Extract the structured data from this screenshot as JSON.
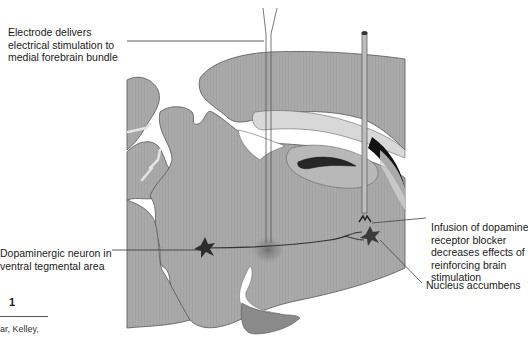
{
  "figure": {
    "number": "1",
    "citation_fragment": "ar, Kelley,"
  },
  "labels": {
    "electrode": [
      "Electrode delivers",
      "electrical stimulation to",
      "medial forebrain bundle"
    ],
    "dopaminergic_neuron": [
      "Dopaminergic neuron in",
      "ventral tegmental area"
    ],
    "infusion": [
      "Infusion of dopamine",
      "receptor blocker",
      "decreases effects of",
      "reinforcing brain",
      "stimulation"
    ],
    "nucleus_accumbens": "Nucleus accumbens"
  },
  "colors": {
    "brain_tissue": "#a9a9a9",
    "brain_outline": "#555555",
    "light_region": "#d6d6d6",
    "dark_region": "#1c1c1c",
    "neuron": "#3a3a3a",
    "stimulation_glow": "#7a7a7a",
    "pituitary": "#8a8a8a",
    "leader_line": "#444444",
    "background": "#ffffff"
  }
}
